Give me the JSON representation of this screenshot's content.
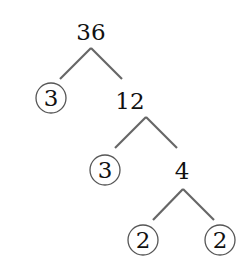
{
  "tree": {
    "root": "36",
    "level1": {
      "left": "3",
      "right": "12"
    },
    "level2": {
      "left": "3",
      "right": "4"
    },
    "level3": {
      "left": "2",
      "right": "2"
    }
  },
  "colors": {
    "line": "#666666",
    "text": "#111111",
    "circle": "#555555"
  }
}
